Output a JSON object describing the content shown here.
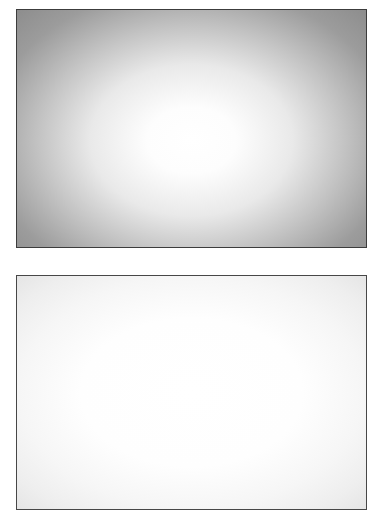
{
  "canvas": {
    "background_color": "#ffffff"
  },
  "panels": {
    "top": {
      "description": "vignetted gray gradient panel, bright center fading to dark gray corners",
      "border_color": "#3c3c3c",
      "gradient": {
        "type": "radial",
        "shape": "ellipse farthest-corner",
        "at": "50% 55%",
        "stops": [
          [
            "#ffffff",
            "0%"
          ],
          [
            "#fdfdfd",
            "18%"
          ],
          [
            "#e9e9e9",
            "41%"
          ],
          [
            "#c3c3c3",
            "62%"
          ],
          [
            "#9c9c9c",
            "83%"
          ],
          [
            "#8d8d8d",
            "100%"
          ]
        ]
      }
    },
    "bottom": {
      "description": "near-white panel with very subtle gray edge falloff",
      "border_color": "#474747",
      "gradient": {
        "type": "radial",
        "shape": "ellipse farthest-corner",
        "at": "50% 50%",
        "stops": [
          [
            "#ffffff",
            "0%"
          ],
          [
            "#fefefe",
            "45%"
          ],
          [
            "#f6f6f6",
            "70%"
          ],
          [
            "#eeeeee",
            "87%"
          ],
          [
            "#e5e5e5",
            "100%"
          ]
        ]
      }
    }
  }
}
